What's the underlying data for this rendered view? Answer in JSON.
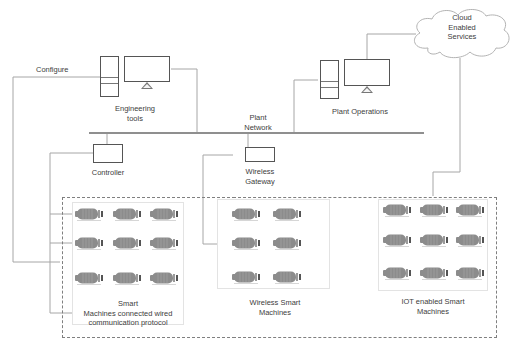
{
  "diagram": {
    "type": "industrial-network-architecture",
    "nodes": {
      "engineering_tools": {
        "label_line1": "Engineering",
        "label_line2": "tools"
      },
      "plant_operations": {
        "label": "Plant Operations"
      },
      "cloud": {
        "label_line1": "Cloud",
        "label_line2": "Enabled",
        "label_line3": "Services"
      },
      "plant_network": {
        "label_line1": "Plant",
        "label_line2": "Network"
      },
      "controller": {
        "label": "Controller"
      },
      "wireless_gateway": {
        "label_line1": "Wireless",
        "label_line2": "Gateway"
      },
      "configure": {
        "label": "Configure"
      }
    },
    "groups": [
      {
        "id": "wired",
        "label_line1": "Smart",
        "label_line2": "Machines connected wired",
        "label_line3": "communication protocol",
        "machines": 9
      },
      {
        "id": "wireless",
        "label_line1": "Wireless Smart",
        "label_line2": "Machines",
        "machines": 6
      },
      {
        "id": "iot",
        "label_line1": "IOT enabled Smart",
        "label_line2": "Machines",
        "machines": 9
      }
    ],
    "edges": [
      {
        "from": "engineering_tools",
        "to": "plant_network"
      },
      {
        "from": "plant_operations",
        "to": "plant_network"
      },
      {
        "from": "plant_operations",
        "to": "cloud"
      },
      {
        "from": "cloud",
        "to": "iot"
      },
      {
        "from": "controller",
        "to": "plant_network"
      },
      {
        "from": "wireless_gateway",
        "to": "plant_network"
      },
      {
        "from": "controller",
        "to": "wired"
      },
      {
        "from": "wireless_gateway",
        "to": "wireless"
      },
      {
        "from": "engineering_tools",
        "to": "wired",
        "label": "Configure"
      }
    ],
    "colors": {
      "line": "#a6a6a6",
      "icon_stroke": "#555555",
      "motor_fill": "#8c8c8c",
      "dashed_border": "#7f7f7f"
    }
  }
}
